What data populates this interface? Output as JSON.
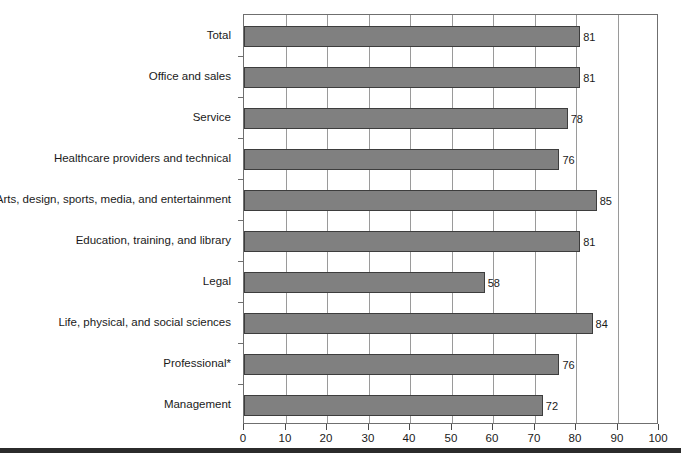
{
  "chart_data": {
    "type": "bar",
    "orientation": "horizontal",
    "title": "",
    "subtitle": "",
    "xlabel": "",
    "ylabel": "",
    "xlim": [
      0,
      100
    ],
    "ylim": null,
    "grid": true,
    "grid_axis": "x",
    "legend": false,
    "legend_position": "none",
    "xticks": [
      0,
      10,
      20,
      30,
      40,
      50,
      60,
      70,
      80,
      90,
      100
    ],
    "xtick_labels": [
      "0",
      "10",
      "20",
      "30",
      "40",
      "50",
      "60",
      "70",
      "80",
      "90",
      "100"
    ],
    "bar_color": "#808080",
    "bar_edge_color": "#3d3d3d",
    "categories": [
      "Total",
      "Office and sales",
      "Service",
      "Healthcare providers and technical",
      "Arts, design, sports, media, and entertainment",
      "Education, training, and library",
      "Legal",
      "Life, physical, and social sciences",
      "Professional*",
      "Management"
    ],
    "values": [
      81,
      81,
      78,
      76,
      85,
      81,
      58,
      84,
      76,
      72
    ],
    "data_labels": [
      "81",
      "81",
      "78",
      "76",
      "85",
      "81",
      "58",
      "84",
      "76",
      "72"
    ],
    "annotations": []
  },
  "colors": {
    "bar_fill": "#808080",
    "bar_edge": "#3d3d3d",
    "gridline": "#9a9a9a",
    "frame": "#6f6f6f",
    "text": "#1a1a1a",
    "rule": "#2b2b2b",
    "background": "#ffffff"
  }
}
